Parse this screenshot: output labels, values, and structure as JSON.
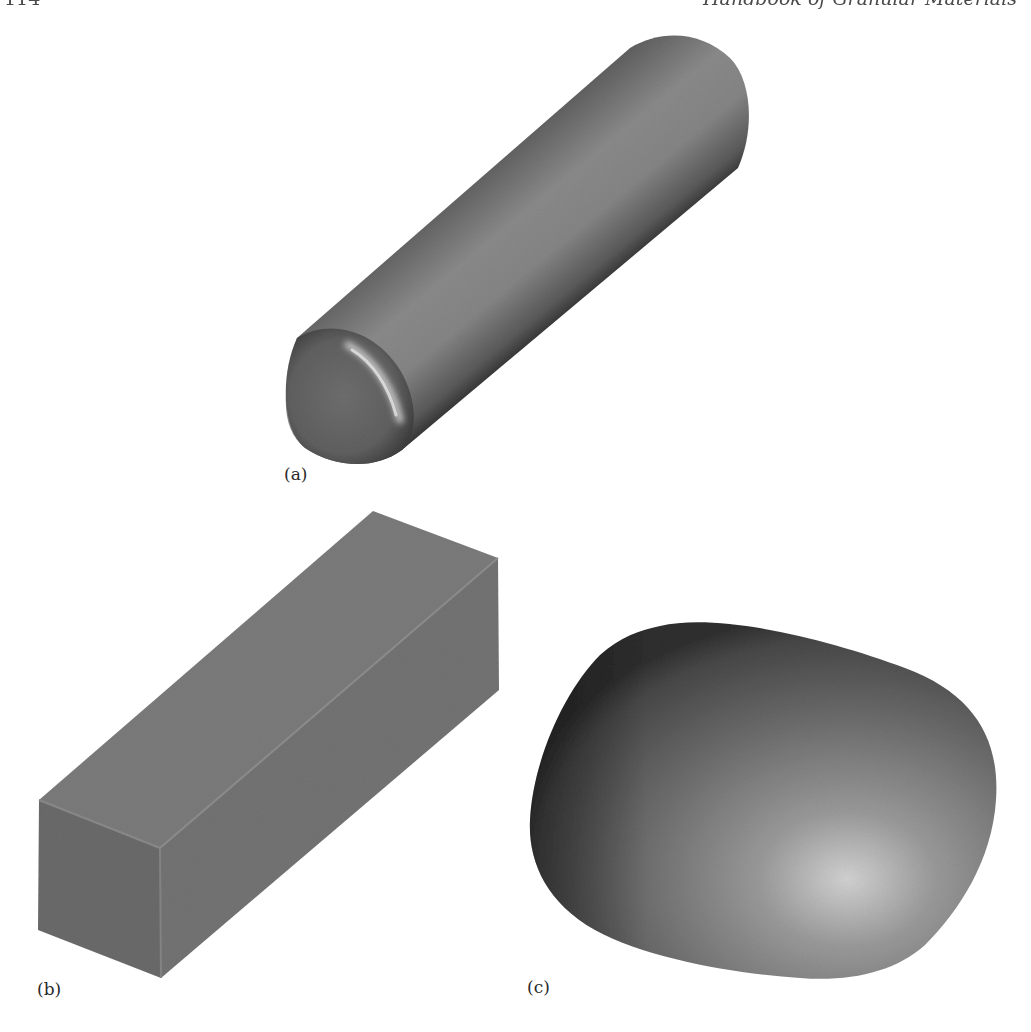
{
  "running_head": {
    "page_number": "114",
    "book_title": "Handbook of Granular Materials"
  },
  "figure": {
    "panels": [
      {
        "id": "a",
        "label": "(a)",
        "shape": "cylinder (spherocylinder with rounded end caps)"
      },
      {
        "id": "b",
        "label": "(b)",
        "shape": "rectangular box (elongated cuboid)"
      },
      {
        "id": "c",
        "label": "(c)",
        "shape": "rounded irregular pebble (superquadric-like body)"
      }
    ],
    "colors": {
      "background": "#ffffff",
      "cylinder_base": "#7a7a7a",
      "box_top": "#7c7c7c",
      "box_front": "#6e6e6e",
      "box_side": "#767676",
      "pebble_base": "#6f6f6f",
      "highlight": "#d8d8d8",
      "label_text": "#2a2a2a"
    }
  }
}
